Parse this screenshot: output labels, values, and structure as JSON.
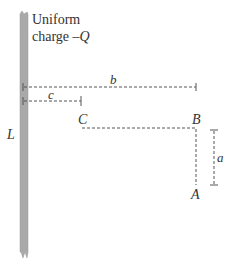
{
  "diagram": {
    "rod": {
      "label": "L",
      "description_line1": "Uniform",
      "description_line2_prefix": "charge ",
      "description_line2_symbol": "–Q",
      "color": "#a9a9a9"
    },
    "dimensions": {
      "b": "b",
      "c": "c",
      "a": "a"
    },
    "points": {
      "A": "A",
      "B": "B",
      "C": "C"
    },
    "line_color": "#555555"
  }
}
